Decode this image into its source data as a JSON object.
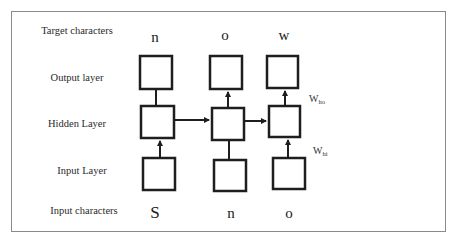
{
  "diagram": {
    "type": "rnn-unrolled-character-model",
    "row_labels": {
      "target": "Target characters",
      "output": "Output layer",
      "hidden": "Hidden Layer",
      "input": "Input Layer",
      "input_chars": "Input characters"
    },
    "target_characters": [
      "n",
      "o",
      "w"
    ],
    "input_characters": [
      "S",
      "n",
      "o"
    ],
    "weights": {
      "hidden_to_output": {
        "base": "W",
        "sub": "ho"
      },
      "input_to_hidden": {
        "base": "W",
        "sub": "hi"
      }
    },
    "timesteps": 3,
    "colors": {
      "stroke": "#1e1e1e",
      "frame": "#8a8a8a",
      "background": "#ffffff"
    }
  }
}
